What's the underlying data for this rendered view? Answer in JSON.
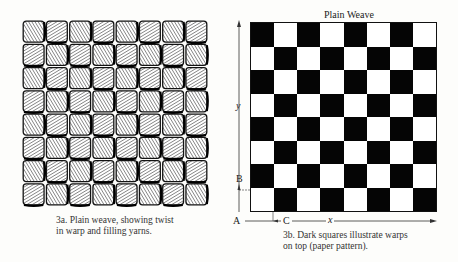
{
  "left_figure": {
    "caption_line1": "3a. Plain weave, showing twist",
    "caption_line2": "in warp and filling yarns.",
    "rows": 8,
    "cols": 8
  },
  "right_figure": {
    "title": "Plain Weave",
    "rows": 8,
    "cols": 8,
    "top_left_dark": true,
    "colors": {
      "dark": "#050505",
      "light": "#ffffff"
    },
    "labels": {
      "y": "y",
      "x": "x",
      "A": "A",
      "B": "B",
      "C": "C"
    },
    "caption_line1": "3b. Dark squares illustrate warps",
    "caption_line2": "on top (paper pattern)."
  }
}
